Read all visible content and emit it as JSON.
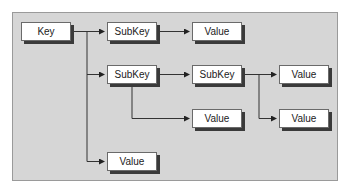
{
  "diagram": {
    "title": "",
    "colors": {
      "panel": "#d6d6d6",
      "node_fill": "#ffffff",
      "node_shadow": "#3a3a3a",
      "line": "#333333"
    },
    "nodes": [
      {
        "id": "key",
        "label": "Key",
        "x": 21,
        "y": 22
      },
      {
        "id": "subkey1",
        "label": "SubKey",
        "x": 107,
        "y": 22
      },
      {
        "id": "value1",
        "label": "Value",
        "x": 192,
        "y": 22
      },
      {
        "id": "subkey2",
        "label": "SubKey",
        "x": 107,
        "y": 65
      },
      {
        "id": "subkey3",
        "label": "SubKey",
        "x": 192,
        "y": 65
      },
      {
        "id": "value2",
        "label": "Value",
        "x": 279,
        "y": 65
      },
      {
        "id": "value3",
        "label": "Value",
        "x": 192,
        "y": 109
      },
      {
        "id": "value4",
        "label": "Value",
        "x": 279,
        "y": 109
      },
      {
        "id": "value5",
        "label": "Value",
        "x": 107,
        "y": 152
      }
    ],
    "edges": [
      {
        "from": "key",
        "to": "subkey1"
      },
      {
        "from": "key",
        "to": "subkey2"
      },
      {
        "from": "key",
        "to": "value5"
      },
      {
        "from": "subkey1",
        "to": "value1"
      },
      {
        "from": "subkey2",
        "to": "subkey3"
      },
      {
        "from": "subkey2",
        "to": "value3"
      },
      {
        "from": "subkey3",
        "to": "value2"
      },
      {
        "from": "subkey3",
        "to": "value4"
      }
    ]
  }
}
